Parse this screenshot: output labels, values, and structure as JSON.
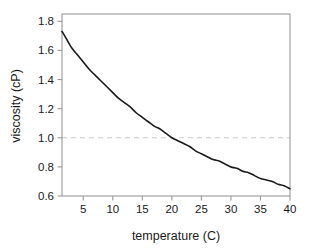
{
  "chart_data": {
    "type": "line",
    "title": "",
    "subtitle": "",
    "xlabel": "temperature (C)",
    "ylabel": "viscosity (cP)",
    "xlim": [
      1.4,
      40
    ],
    "ylim": [
      0.6,
      1.85
    ],
    "xticks": [
      5,
      10,
      15,
      20,
      25,
      30,
      35,
      40
    ],
    "xticklabels": [
      "5",
      "10",
      "15",
      "20",
      "25",
      "30",
      "35",
      "40"
    ],
    "yticks": [
      0.6,
      0.8,
      1.0,
      1.2,
      1.4,
      1.6,
      1.8
    ],
    "yticklabels": [
      "0.6",
      "0.8",
      "1.0",
      "1.2",
      "1.4",
      "1.6",
      "1.8"
    ],
    "grid": false,
    "legend": false,
    "legend_position": "none",
    "series": [
      {
        "name": "viscosity",
        "color": "#1a1a1a",
        "linewidth": 1.6,
        "linestyle": "solid",
        "x": [
          1.4,
          2,
          3,
          4,
          5,
          6,
          7,
          8,
          9,
          10,
          11,
          12,
          13,
          14,
          15,
          16,
          17,
          18,
          19,
          20,
          21,
          22,
          23,
          24,
          25,
          26,
          27,
          28,
          29,
          30,
          31,
          32,
          33,
          34,
          35,
          36,
          37,
          38,
          39,
          40
        ],
        "values": [
          1.73,
          1.69,
          1.62,
          1.57,
          1.52,
          1.47,
          1.43,
          1.39,
          1.35,
          1.31,
          1.27,
          1.24,
          1.21,
          1.17,
          1.14,
          1.11,
          1.08,
          1.06,
          1.03,
          1.0,
          0.98,
          0.96,
          0.94,
          0.91,
          0.89,
          0.87,
          0.85,
          0.84,
          0.82,
          0.8,
          0.79,
          0.77,
          0.76,
          0.74,
          0.72,
          0.71,
          0.7,
          0.68,
          0.67,
          0.65
        ]
      }
    ],
    "annotations": [
      {
        "name": "reference-line",
        "type": "hline",
        "y": 1.0,
        "color": "#cccccc",
        "linestyle": "dashed",
        "label": ""
      }
    ],
    "frame_color": "#999999",
    "background_color": "#ffffff"
  }
}
